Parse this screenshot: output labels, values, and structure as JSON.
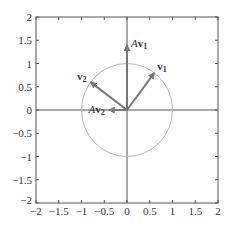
{
  "chart_data": {
    "type": "line",
    "title": "",
    "xlabel": "",
    "ylabel": "",
    "xlim": [
      -2,
      2
    ],
    "ylim": [
      -2,
      2
    ],
    "grid": false,
    "xticks": [
      "−2",
      "−1.5",
      "−1",
      "−0.5",
      "0",
      "0.5",
      "1",
      "1.5",
      "2"
    ],
    "yticks": [
      "2",
      "1.5",
      "1",
      "0.5",
      "0",
      "−0.5",
      "−1",
      "−1.5",
      "−2"
    ],
    "unit_circle": {
      "center": [
        0,
        0
      ],
      "radius": 1,
      "color": "#b0b0b0"
    },
    "vectors": [
      {
        "name": "v1",
        "label": "v",
        "sub": "1",
        "prefix": "",
        "x": 0.6,
        "y": 0.8
      },
      {
        "name": "v2",
        "label": "v",
        "sub": "2",
        "prefix": "",
        "x": -0.8,
        "y": 0.6
      },
      {
        "name": "Av1",
        "label": "v",
        "sub": "1",
        "prefix": "A",
        "x": 0,
        "y": 1.4
      },
      {
        "name": "Av2",
        "label": "v",
        "sub": "2",
        "prefix": "A",
        "x": -0.4,
        "y": 0
      }
    ],
    "colors": {
      "axes": "#555555",
      "vectors": "#777777",
      "circle": "#b8b8b8"
    }
  }
}
